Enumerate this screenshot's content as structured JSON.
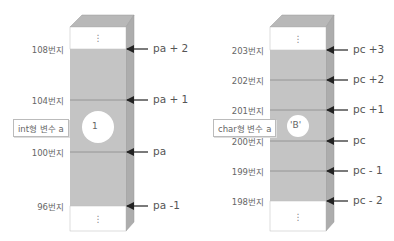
{
  "left_diagram": {
    "pointer_name": "pa",
    "variable_label": "int형 변수 a",
    "variable_value": "1",
    "rows": [
      {
        "address": "108번지",
        "pointer": "pa + 2"
      },
      {
        "address": "104번지",
        "pointer": "pa + 1"
      },
      {
        "address": "100번지",
        "pointer": "pa"
      },
      {
        "address": "96번지",
        "pointer": "pa -1"
      }
    ],
    "ellipsis_top": "⋮",
    "ellipsis_bottom": "⋮"
  },
  "right_diagram": {
    "pointer_name": "pc",
    "variable_label": "char형 변수 a",
    "variable_value": "'B'",
    "rows": [
      {
        "address": "203번지",
        "pointer": "pc +3"
      },
      {
        "address": "202번지",
        "pointer": "pc +2"
      },
      {
        "address": "201번지",
        "pointer": "pc +1"
      },
      {
        "address": "200번지",
        "pointer": "pc"
      },
      {
        "address": "199번지",
        "pointer": "pc - 1"
      },
      {
        "address": "198번지",
        "pointer": "pc - 2"
      }
    ],
    "ellipsis_top": "⋮",
    "ellipsis_bottom": "⋮"
  },
  "colors": {
    "memory_fill": "#c4c4c4",
    "memory_side": "#adadad",
    "memory_top": "#b8b8b8",
    "empty_cell": "#ffffff",
    "divider": "#8a8a8a",
    "arrow": "#222222"
  }
}
